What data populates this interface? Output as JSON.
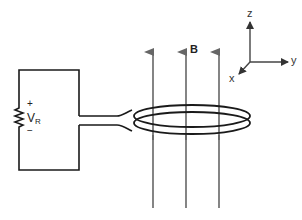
{
  "diagram": {
    "field_label": "B",
    "resistor": {
      "voltage_symbol": "V",
      "voltage_subscript": "R",
      "plus_sign": "+",
      "minus_sign": "−"
    },
    "axes": {
      "z_label": "z",
      "y_label": "y",
      "x_label": "x"
    },
    "field_line_count": 3,
    "colors": {
      "wire": "#1a1a1a",
      "field_lines": "#666666",
      "axes": "#444444"
    }
  }
}
